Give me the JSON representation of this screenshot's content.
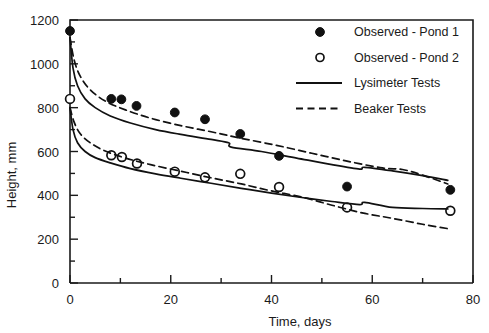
{
  "chart_data": {
    "type": "scatter",
    "title": "",
    "xlabel": "Time, days",
    "ylabel": "Height, mm",
    "xlim": [
      0,
      80
    ],
    "ylim": [
      0,
      1200
    ],
    "xticks": [
      0,
      20,
      40,
      60,
      80
    ],
    "xtick_labels": [
      "0",
      "20",
      "40",
      "60",
      "80"
    ],
    "xminor_step": 10,
    "yticks": [
      0,
      200,
      400,
      600,
      800,
      1000,
      1200
    ],
    "ytick_labels": [
      "0",
      "200",
      "400",
      "600",
      "800",
      "1000",
      "1200"
    ],
    "yminor_step": 100,
    "grid": false,
    "legend_position": "top-right",
    "series": [
      {
        "name": "Observed - Pond 1",
        "marker": "filled-circle",
        "style": "points",
        "points": [
          {
            "x": 0,
            "y": 1150
          },
          {
            "x": 8.2,
            "y": 840
          },
          {
            "x": 10.2,
            "y": 838
          },
          {
            "x": 13.2,
            "y": 808
          },
          {
            "x": 20.8,
            "y": 778
          },
          {
            "x": 26.8,
            "y": 747
          },
          {
            "x": 33.8,
            "y": 680
          },
          {
            "x": 41.5,
            "y": 580
          },
          {
            "x": 55.0,
            "y": 440
          },
          {
            "x": 75.5,
            "y": 425
          }
        ]
      },
      {
        "name": "Observed - Pond 2",
        "marker": "open-circle",
        "style": "points",
        "points": [
          {
            "x": 0,
            "y": 840
          },
          {
            "x": 8.2,
            "y": 583
          },
          {
            "x": 10.3,
            "y": 575
          },
          {
            "x": 13.3,
            "y": 545
          },
          {
            "x": 20.8,
            "y": 508
          },
          {
            "x": 26.8,
            "y": 482
          },
          {
            "x": 33.8,
            "y": 498
          },
          {
            "x": 41.5,
            "y": 438
          },
          {
            "x": 55.0,
            "y": 345
          },
          {
            "x": 75.5,
            "y": 330
          }
        ]
      },
      {
        "name": "Lysimeter Tests",
        "marker": "none",
        "style": "solid-line",
        "curves": [
          {
            "id": "upper-lysimeter",
            "points": [
              {
                "x": 0.0,
                "y": 1120
              },
              {
                "x": 0.6,
                "y": 980
              },
              {
                "x": 1.5,
                "y": 900
              },
              {
                "x": 3.0,
                "y": 840
              },
              {
                "x": 5.0,
                "y": 800
              },
              {
                "x": 8.0,
                "y": 762
              },
              {
                "x": 12.0,
                "y": 730
              },
              {
                "x": 17.0,
                "y": 700
              },
              {
                "x": 22.0,
                "y": 678
              },
              {
                "x": 28.0,
                "y": 655
              },
              {
                "x": 31.5,
                "y": 640
              },
              {
                "x": 32.0,
                "y": 620
              },
              {
                "x": 38.0,
                "y": 600
              },
              {
                "x": 45.0,
                "y": 570
              },
              {
                "x": 52.0,
                "y": 540
              },
              {
                "x": 57.5,
                "y": 520
              },
              {
                "x": 58.5,
                "y": 528
              },
              {
                "x": 64.0,
                "y": 512
              },
              {
                "x": 70.0,
                "y": 490
              },
              {
                "x": 75.0,
                "y": 468
              }
            ]
          },
          {
            "id": "lower-lysimeter",
            "points": [
              {
                "x": 0.0,
                "y": 800
              },
              {
                "x": 0.6,
                "y": 700
              },
              {
                "x": 1.5,
                "y": 640
              },
              {
                "x": 3.0,
                "y": 600
              },
              {
                "x": 5.0,
                "y": 572
              },
              {
                "x": 8.0,
                "y": 548
              },
              {
                "x": 12.0,
                "y": 522
              },
              {
                "x": 17.0,
                "y": 498
              },
              {
                "x": 22.0,
                "y": 478
              },
              {
                "x": 28.0,
                "y": 455
              },
              {
                "x": 34.0,
                "y": 432
              },
              {
                "x": 40.0,
                "y": 410
              },
              {
                "x": 46.0,
                "y": 390
              },
              {
                "x": 52.0,
                "y": 372
              },
              {
                "x": 57.5,
                "y": 358
              },
              {
                "x": 58.5,
                "y": 368
              },
              {
                "x": 64.0,
                "y": 345
              },
              {
                "x": 70.0,
                "y": 340
              },
              {
                "x": 75.0,
                "y": 338
              }
            ]
          }
        ]
      },
      {
        "name": "Beaker Tests",
        "marker": "none",
        "style": "dashed-line",
        "curves": [
          {
            "id": "upper-beaker",
            "points": [
              {
                "x": 0.0,
                "y": 1120
              },
              {
                "x": 0.8,
                "y": 1020
              },
              {
                "x": 2.0,
                "y": 945
              },
              {
                "x": 4.0,
                "y": 882
              },
              {
                "x": 7.0,
                "y": 830
              },
              {
                "x": 11.0,
                "y": 790
              },
              {
                "x": 16.0,
                "y": 752
              },
              {
                "x": 22.0,
                "y": 718
              },
              {
                "x": 28.0,
                "y": 690
              },
              {
                "x": 34.0,
                "y": 660
              },
              {
                "x": 41.0,
                "y": 628
              },
              {
                "x": 48.0,
                "y": 592
              },
              {
                "x": 55.0,
                "y": 556
              },
              {
                "x": 62.0,
                "y": 525
              },
              {
                "x": 66.0,
                "y": 518
              },
              {
                "x": 70.0,
                "y": 492
              },
              {
                "x": 75.0,
                "y": 452
              }
            ]
          },
          {
            "id": "lower-beaker",
            "points": [
              {
                "x": 0.0,
                "y": 800
              },
              {
                "x": 0.8,
                "y": 735
              },
              {
                "x": 2.0,
                "y": 682
              },
              {
                "x": 4.0,
                "y": 640
              },
              {
                "x": 7.0,
                "y": 602
              },
              {
                "x": 11.0,
                "y": 570
              },
              {
                "x": 16.0,
                "y": 540
              },
              {
                "x": 22.0,
                "y": 510
              },
              {
                "x": 28.0,
                "y": 480
              },
              {
                "x": 34.0,
                "y": 452
              },
              {
                "x": 40.0,
                "y": 420
              },
              {
                "x": 46.0,
                "y": 392
              },
              {
                "x": 52.0,
                "y": 355
              },
              {
                "x": 58.0,
                "y": 320
              },
              {
                "x": 64.0,
                "y": 295
              },
              {
                "x": 70.0,
                "y": 268
              },
              {
                "x": 75.0,
                "y": 248
              }
            ]
          }
        ]
      }
    ]
  },
  "legend": {
    "items": [
      {
        "label": "Observed - Pond 1",
        "type": "filled-circle"
      },
      {
        "label": "Observed - Pond 2",
        "type": "open-circle"
      },
      {
        "label": "Lysimeter Tests",
        "type": "solid-line"
      },
      {
        "label": "Beaker Tests",
        "type": "dashed-line"
      }
    ]
  },
  "colors": {
    "axis": "#1a1a1a",
    "marker_fill": "#111111",
    "marker_open_fill": "#ffffff",
    "line": "#111111",
    "background": "#ffffff"
  }
}
